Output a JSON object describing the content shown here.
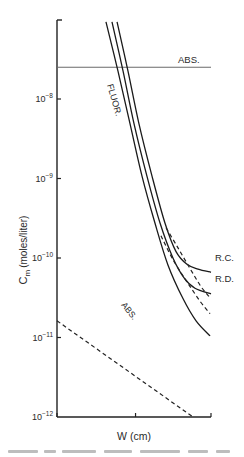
{
  "chart_data": {
    "type": "line",
    "title": "",
    "xlabel": "W (cm)",
    "ylabel": "C_m (moles/liter)",
    "ylabel_main": "C",
    "ylabel_sub": "m",
    "ylabel_rest": "(moles/liter)",
    "yscale": "log",
    "ylim": [
      1e-12,
      1.6e-07
    ],
    "xlim": [
      0,
      1
    ],
    "x_ticks_unlabeled": [
      0,
      0.51,
      1
    ],
    "y_ticks": [
      {
        "exp": "-8",
        "value": 1e-08
      },
      {
        "exp": "-9",
        "value": 1e-09
      },
      {
        "exp": "-10",
        "value": 1e-10
      },
      {
        "exp": "-11",
        "value": 1e-11
      },
      {
        "exp": "-12",
        "value": 1e-12
      }
    ],
    "grid": false,
    "legend": "none (inline labels)",
    "series": [
      {
        "name": "ABS. (horizontal)",
        "label": "ABS.",
        "style": "solid-gray",
        "x": [
          0,
          1
        ],
        "log10_y": [
          -7.6,
          -7.6
        ]
      },
      {
        "name": "FLUOR.",
        "label": "FLUOR.",
        "style": "solid",
        "x": [
          0.318,
          0.396,
          0.474,
          0.552,
          0.636,
          0.721,
          0.818,
          0.903,
          0.994
        ],
        "log10_y": [
          -7.03,
          -7.65,
          -8.31,
          -8.97,
          -9.56,
          -10.09,
          -10.51,
          -10.79,
          -10.98
        ]
      },
      {
        "name": "R.D.",
        "label": "R.D.",
        "style": "solid",
        "x": [
          0.357,
          0.429,
          0.5,
          0.584,
          0.669,
          0.753,
          0.825,
          0.896,
          1.0
        ],
        "log10_y": [
          -7.03,
          -7.65,
          -8.31,
          -8.97,
          -9.56,
          -10.0,
          -10.25,
          -10.38,
          -10.45
        ]
      },
      {
        "name": "R.C.",
        "label": "R.C.",
        "style": "solid",
        "x": [
          0.39,
          0.461,
          0.532,
          0.617,
          0.701,
          0.773,
          0.844,
          0.916,
          1.0
        ],
        "log10_y": [
          -7.03,
          -7.65,
          -8.31,
          -8.97,
          -9.56,
          -9.92,
          -10.08,
          -10.14,
          -10.18
        ]
      },
      {
        "name": "R.D. dashed extension",
        "label": "",
        "style": "dashed",
        "x": [
          0.675,
          0.753,
          0.844,
          0.935,
          0.994
        ],
        "log10_y": [
          -9.72,
          -10.02,
          -10.3,
          -10.56,
          -10.7
        ]
      },
      {
        "name": "R.C. dashed extension",
        "label": "",
        "style": "dashed",
        "x": [
          0.708,
          0.779,
          0.857,
          0.935,
          0.994
        ],
        "log10_y": [
          -9.62,
          -9.85,
          -10.11,
          -10.36,
          -10.5
        ]
      },
      {
        "name": "ABS. (dashed diagonal)",
        "label": "ABS.",
        "style": "dashed",
        "x": [
          0,
          0.883
        ],
        "log10_y": [
          -10.79,
          -12.0
        ]
      }
    ],
    "annotations": [
      {
        "text": "ABS.",
        "near": "horizontal line, right side"
      },
      {
        "text": "FLUOR.",
        "near": "left solid curve, rotated"
      },
      {
        "text": "R.C.",
        "near": "upper right curve end"
      },
      {
        "text": "R.D.",
        "near": "middle right curve end"
      },
      {
        "text": "ABS.",
        "near": "dashed diagonal line, rotated"
      }
    ]
  },
  "labels": {
    "abs_top": "ABS.",
    "fluor": "FLUOR.",
    "rc": "R.C.",
    "rd": "R.D.",
    "abs_dashed": "ABS.",
    "tick_base": "10"
  }
}
